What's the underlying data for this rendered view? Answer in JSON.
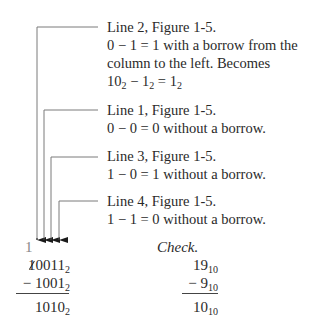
{
  "annotations": [
    {
      "id": "line2",
      "title": "Line 2, Figure 1-5.",
      "lines": [
        "0 − 1 = 1 with a borrow from the",
        "column to the left. Becomes"
      ],
      "equation": {
        "a": "10",
        "a_base": "2",
        "op": " − ",
        "b": "1",
        "b_base": "2",
        "eq": " = ",
        "c": "1",
        "c_base": "2"
      }
    },
    {
      "id": "line1",
      "title": "Line 1, Figure 1-5.",
      "lines": [
        "0 − 0 = 0 without a borrow."
      ]
    },
    {
      "id": "line3",
      "title": "Line 3, Figure 1-5.",
      "lines": [
        "1 − 0 = 1 without a borrow."
      ]
    },
    {
      "id": "line4",
      "title": "Line 4, Figure 1-5.",
      "lines": [
        "1 − 1 = 0 without a borrow."
      ]
    }
  ],
  "binary_subtraction": {
    "borrow_digit": "1",
    "minuend_struck_digit": "1",
    "minuend_rest": "0011",
    "minuend_base": "2",
    "operator": "−",
    "subtrahend": "1001",
    "subtrahend_base": "2",
    "result": "1010",
    "result_base": "2"
  },
  "check": {
    "label": "Check.",
    "minuend": "19",
    "minuend_base": "10",
    "operator": "−",
    "subtrahend": "9",
    "subtrahend_base": "10",
    "result": "10",
    "result_base": "10"
  },
  "colors": {
    "leader_line": "#7a7a7a",
    "text": "#2a2a2a",
    "carry": "#888888"
  }
}
